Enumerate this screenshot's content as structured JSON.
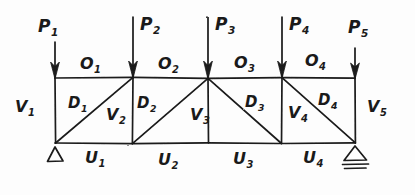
{
  "figure": {
    "style": "hand-drawn pencil sketch",
    "ink_color": "#1a1a1a",
    "background_color": "#fdfdfd"
  },
  "geometry": {
    "panels": 4,
    "top_chord_y": 78,
    "bottom_chord_y": 143,
    "node_x": [
      55,
      133,
      208,
      282,
      355
    ]
  },
  "loads": [
    {
      "name": "P1",
      "base": "P",
      "sub": "1",
      "label_x": 38,
      "label_y": 18,
      "arrow_x": 55,
      "arrow_top": 42,
      "arrow_bottom": 78
    },
    {
      "name": "P2",
      "base": "P",
      "sub": "2",
      "label_x": 140,
      "label_y": 16,
      "arrow_x": 133,
      "arrow_top": 17,
      "arrow_bottom": 78
    },
    {
      "name": "P3",
      "base": "P",
      "sub": "3",
      "label_x": 215,
      "label_y": 16,
      "arrow_x": 208,
      "arrow_top": 17,
      "arrow_bottom": 78
    },
    {
      "name": "P4",
      "base": "P",
      "sub": "4",
      "label_x": 289,
      "label_y": 16,
      "arrow_x": 282,
      "arrow_top": 17,
      "arrow_bottom": 78
    },
    {
      "name": "P5",
      "base": "P",
      "sub": "5",
      "label_x": 348,
      "label_y": 19,
      "arrow_x": 355,
      "arrow_top": 48,
      "arrow_bottom": 78
    }
  ],
  "top_chord": [
    {
      "name": "O1",
      "base": "O",
      "sub": "1",
      "label_x": 80,
      "label_y": 56
    },
    {
      "name": "O2",
      "base": "O",
      "sub": "2",
      "label_x": 158,
      "label_y": 56
    },
    {
      "name": "O3",
      "base": "O",
      "sub": "3",
      "label_x": 234,
      "label_y": 55
    },
    {
      "name": "O4",
      "base": "O",
      "sub": "4",
      "label_x": 305,
      "label_y": 53
    }
  ],
  "bottom_chord": [
    {
      "name": "U1",
      "base": "U",
      "sub": "1",
      "label_x": 85,
      "label_y": 150
    },
    {
      "name": "U2",
      "base": "U",
      "sub": "2",
      "label_x": 158,
      "label_y": 152
    },
    {
      "name": "U3",
      "base": "U",
      "sub": "3",
      "label_x": 233,
      "label_y": 151
    },
    {
      "name": "U4",
      "base": "U",
      "sub": "4",
      "label_x": 303,
      "label_y": 150
    }
  ],
  "verticals": [
    {
      "name": "V1",
      "base": "V",
      "sub": "1",
      "label_x": 15,
      "label_y": 99
    },
    {
      "name": "V2",
      "base": "V",
      "sub": "2",
      "label_x": 106,
      "label_y": 107
    },
    {
      "name": "V3",
      "base": "V",
      "sub": "3",
      "label_x": 190,
      "label_y": 107
    },
    {
      "name": "V4",
      "base": "V",
      "sub": "4",
      "label_x": 288,
      "label_y": 105
    },
    {
      "name": "V5",
      "base": "V",
      "sub": "5",
      "label_x": 367,
      "label_y": 99
    }
  ],
  "diagonals": [
    {
      "name": "D1",
      "base": "D",
      "sub": "1",
      "direction": "up-right",
      "label_x": 68,
      "label_y": 96
    },
    {
      "name": "D2",
      "base": "D",
      "sub": "2",
      "direction": "up-right",
      "label_x": 137,
      "label_y": 96
    },
    {
      "name": "D3",
      "base": "D",
      "sub": "3",
      "direction": "down-right",
      "label_x": 245,
      "label_y": 95
    },
    {
      "name": "D4",
      "base": "D",
      "sub": "4",
      "direction": "down-right",
      "label_x": 318,
      "label_y": 93
    }
  ],
  "supports": [
    {
      "name": "pin-support",
      "type": "pin",
      "x": 55,
      "y": 143
    },
    {
      "name": "roller-support",
      "type": "roller",
      "x": 355,
      "y": 143
    }
  ]
}
